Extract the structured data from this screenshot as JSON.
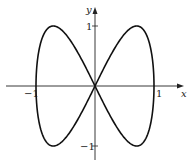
{
  "chart_data": {
    "type": "line",
    "title": "",
    "xlabel": "x",
    "ylabel": "y",
    "xlim": [
      -1.2,
      1.2
    ],
    "ylim": [
      -1.2,
      1.2
    ],
    "grid": false,
    "legend": null,
    "x_ticks": [
      {
        "value": -1,
        "label": "−1"
      },
      {
        "value": 1,
        "label": "1"
      }
    ],
    "y_ticks": [
      {
        "value": 1,
        "label": "1"
      },
      {
        "value": -1,
        "label": "−1"
      }
    ],
    "curve_description": "Lissajous figure-eight curve x = sin t, y = sin 2t",
    "series": [
      {
        "name": "curve",
        "color": "#000000",
        "parametric": {
          "x": "sin(t)",
          "y": "sin(2t)",
          "t_range": [
            0,
            6.2832
          ]
        },
        "key_points": [
          {
            "x": 0,
            "y": 0
          },
          {
            "x": 0.707,
            "y": 1
          },
          {
            "x": 1,
            "y": 0
          },
          {
            "x": 0.707,
            "y": -1
          },
          {
            "x": -0.707,
            "y": 1
          },
          {
            "x": -1,
            "y": 0
          },
          {
            "x": -0.707,
            "y": -1
          }
        ]
      }
    ]
  },
  "labels": {
    "x_axis": "x",
    "y_axis": "y",
    "x_tick_neg1": "−1",
    "x_tick_1": "1",
    "y_tick_1": "1",
    "y_tick_neg1": "−1"
  }
}
